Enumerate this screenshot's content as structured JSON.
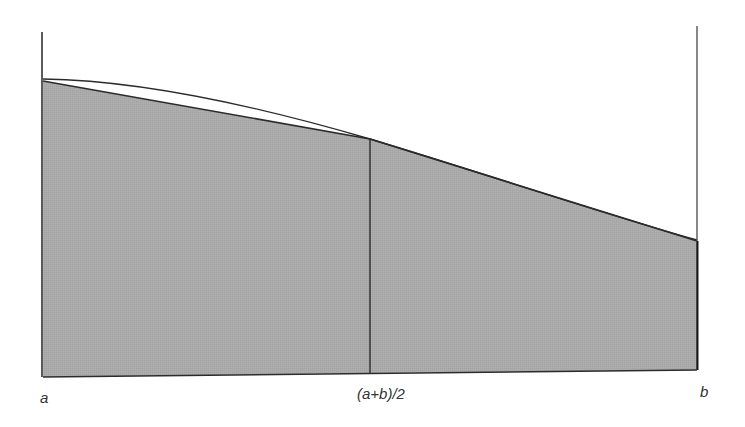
{
  "diagram": {
    "type": "trapezoid-rule-area-illustration",
    "labels": {
      "left": "a",
      "midpoint": "(a+b)/2",
      "right": "b"
    },
    "colors": {
      "fill": "#a9a9a9",
      "line": "#2b2b2b",
      "background": "#ffffff"
    },
    "regions": [
      {
        "name": "left-trapezoid",
        "from": "a",
        "to": "(a+b)/2"
      },
      {
        "name": "right-trapezoid",
        "from": "(a+b)/2",
        "to": "b"
      }
    ]
  }
}
